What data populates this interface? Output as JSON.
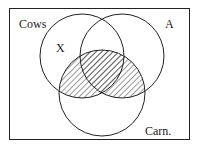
{
  "diagram": {
    "type": "venn",
    "universe_label": "Cows",
    "sets": [
      {
        "id": "left",
        "label": "X"
      },
      {
        "id": "right",
        "label": "A"
      },
      {
        "id": "bottom",
        "label": "Carn."
      }
    ],
    "shaded_region": "bottom ∩ (left ∪ right)",
    "colors": {
      "stroke": "#222222",
      "hatch": "#333333",
      "background": "#ffffff"
    }
  }
}
